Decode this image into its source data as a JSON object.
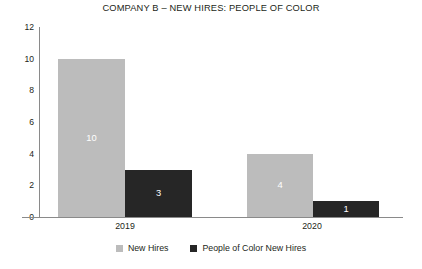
{
  "chart_data": {
    "type": "bar",
    "title": "COMPANY B – NEW HIRES: PEOPLE OF COLOR",
    "xlabel": "",
    "ylabel": "",
    "ylim": [
      0,
      12
    ],
    "yticks": [
      "0",
      "2",
      "4",
      "6",
      "8",
      "10",
      "12"
    ],
    "grid": false,
    "legend_position": "bottom-center",
    "categories": [
      "2019",
      "2020"
    ],
    "series": [
      {
        "name": "New Hires",
        "color": "#bcbcbc",
        "values": [
          10,
          4
        ],
        "labels": [
          "10",
          "4"
        ]
      },
      {
        "name": "People of Color New Hires",
        "color": "#262626",
        "values": [
          3,
          1
        ],
        "labels": [
          "3",
          "1"
        ]
      }
    ]
  },
  "legend": {
    "items": [
      {
        "label": "New Hires"
      },
      {
        "label": "People of Color New Hires"
      }
    ]
  },
  "colors": {
    "series_a": "#bcbcbc",
    "series_b": "#262626",
    "axis": "#8a8a8a",
    "text": "#231f20",
    "value_label": "#ffffff",
    "background": "#ffffff"
  }
}
